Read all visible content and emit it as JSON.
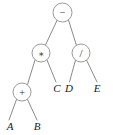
{
  "diagram": {
    "type": "expression-tree",
    "expression": "(A + B) * C - D / E",
    "colors": {
      "background": "#ffffff",
      "node_stroke": "#9a9a9a",
      "node_fill": "#ffffff",
      "edge_stroke": "#8a8a8a",
      "operator_text": "#2b2b2b",
      "leaf_text": "#1a1a1a"
    },
    "operator_nodes": [
      {
        "id": "root",
        "label": "−",
        "symbol_name": "minus-operator",
        "cx": 62.5,
        "cy": 12.5,
        "r": 9.5,
        "font_size": 10
      },
      {
        "id": "multiply",
        "label": "∗",
        "symbol_name": "asterisk-operator",
        "cx": 41.0,
        "cy": 53.0,
        "r": 9.0,
        "font_size": 9
      },
      {
        "id": "divide",
        "label": "/",
        "symbol_name": "slash-operator",
        "cx": 81.0,
        "cy": 53.0,
        "r": 9.0,
        "font_size": 11
      },
      {
        "id": "plus",
        "label": "+",
        "symbol_name": "plus-operator",
        "cx": 22.0,
        "cy": 92.0,
        "r": 9.0,
        "font_size": 10
      }
    ],
    "leaf_nodes": [
      {
        "id": "leaf-a",
        "label": "A",
        "x": 10.0,
        "y": 130.0,
        "font_size": 11
      },
      {
        "id": "leaf-b",
        "label": "B",
        "x": 37.0,
        "y": 130.0,
        "font_size": 11
      },
      {
        "id": "leaf-c",
        "label": "C",
        "x": 57.0,
        "y": 92.0,
        "font_size": 11
      },
      {
        "id": "leaf-d",
        "label": "D",
        "x": 69.0,
        "y": 92.0,
        "font_size": 11
      },
      {
        "id": "leaf-e",
        "label": "E",
        "x": 97.0,
        "y": 92.0,
        "font_size": 11
      }
    ],
    "edges": [
      {
        "id": "edge-root-multiply",
        "from": "root",
        "to": "multiply",
        "x1": 57.0,
        "y1": 20.5,
        "x2": 45.5,
        "y2": 45.0
      },
      {
        "id": "edge-root-divide",
        "from": "root",
        "to": "divide",
        "x1": 68.5,
        "y1": 20.0,
        "x2": 76.5,
        "y2": 45.5
      },
      {
        "id": "edge-multiply-plus",
        "from": "multiply",
        "to": "plus",
        "x1": 35.0,
        "y1": 60.0,
        "x2": 27.5,
        "y2": 84.5
      },
      {
        "id": "edge-multiply-c",
        "from": "multiply",
        "to": "leaf-c",
        "x1": 47.0,
        "y1": 60.0,
        "x2": 56.0,
        "y2": 82.0
      },
      {
        "id": "edge-divide-d",
        "from": "divide",
        "to": "leaf-d",
        "x1": 75.5,
        "y1": 60.0,
        "x2": 69.5,
        "y2": 82.0
      },
      {
        "id": "edge-divide-e",
        "from": "divide",
        "to": "leaf-e",
        "x1": 86.5,
        "y1": 60.0,
        "x2": 97.0,
        "y2": 82.0
      },
      {
        "id": "edge-plus-a",
        "from": "plus",
        "to": "leaf-a",
        "x1": 16.5,
        "y1": 99.5,
        "x2": 9.0,
        "y2": 120.0
      },
      {
        "id": "edge-plus-b",
        "from": "plus",
        "to": "leaf-b",
        "x1": 27.5,
        "y1": 99.5,
        "x2": 37.0,
        "y2": 120.0
      }
    ]
  }
}
